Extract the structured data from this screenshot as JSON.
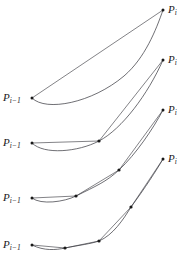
{
  "figure": {
    "name": "iterative-curve-subdivision-diagram",
    "background": "#ffffff",
    "width": 185,
    "height": 265,
    "stroke_color": "#3f3f46",
    "point_color": "#1a1a1a",
    "labels": {
      "start_base": "P",
      "start_sub": "i−1",
      "end_base": "P",
      "end_sub": "i"
    },
    "rows": [
      {
        "id": "row-1",
        "label_left": {
          "base": "P",
          "sub": "i−1",
          "x": 3,
          "y": 91
        },
        "label_right": {
          "base": "P",
          "sub": "i",
          "x": 168,
          "y": 3
        },
        "start_point": {
          "x": 32,
          "y": 98
        },
        "end_point": {
          "x": 163,
          "y": 10
        },
        "interior_points": [],
        "chord_path": "M 32 98 L 163 10",
        "curve_path": "M 32 98 C 46 112 92 103 124 76 C 145 58 156 30 163 10"
      },
      {
        "id": "row-2",
        "label_left": {
          "base": "P",
          "sub": "i−1",
          "x": 3,
          "y": 136
        },
        "label_right": {
          "base": "P",
          "sub": "i",
          "x": 168,
          "y": 53
        },
        "start_point": {
          "x": 32,
          "y": 143
        },
        "end_point": {
          "x": 163,
          "y": 60
        },
        "interior_points": [
          {
            "x": 99,
            "y": 141
          }
        ],
        "chord_path": "M 32 143 L 99 141 L 163 60",
        "curve_path": "M 32 143 C 44 155 78 152 99 141 C 122 129 148 94 163 60"
      },
      {
        "id": "row-3",
        "label_left": {
          "base": "P",
          "sub": "i−1",
          "x": 3,
          "y": 191
        },
        "label_right": {
          "base": "P",
          "sub": "i",
          "x": 168,
          "y": 103
        },
        "start_point": {
          "x": 32,
          "y": 198
        },
        "end_point": {
          "x": 163,
          "y": 110
        },
        "interior_points": [
          {
            "x": 76,
            "y": 196
          },
          {
            "x": 119,
            "y": 170
          }
        ],
        "chord_path": "M 32 198 L 76 196 L 119 170 L 163 110",
        "curve_path": "M 32 198 C 41 205 64 202 76 196 C 96 186 106 182 119 170 C 136 154 153 129 163 110"
      },
      {
        "id": "row-4",
        "label_left": {
          "base": "P",
          "sub": "i−1",
          "x": 3,
          "y": 238
        },
        "label_right": {
          "base": "P",
          "sub": "i",
          "x": 168,
          "y": 152
        },
        "start_point": {
          "x": 32,
          "y": 245
        },
        "end_point": {
          "x": 163,
          "y": 159
        },
        "interior_points": [
          {
            "x": 65,
            "y": 248
          },
          {
            "x": 99,
            "y": 241
          },
          {
            "x": 131,
            "y": 207
          }
        ],
        "chord_path": "M 32 245 L 65 248 L 99 241 L 131 207 L 163 159",
        "curve_path": "M 32 245 C 44 251 56 250 65 248 C 80 245 90 244 99 241 C 113 235 123 220 131 207 C 145 188 156 171 163 159"
      }
    ]
  }
}
